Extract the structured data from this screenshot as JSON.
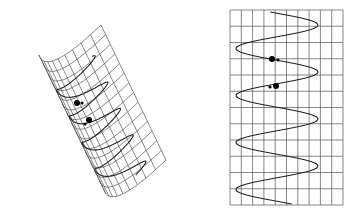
{
  "figure": {
    "colors": {
      "grid": "#555555",
      "curve": "#222222",
      "dot": "#000000",
      "background": "#ffffff"
    }
  },
  "left_panel": {
    "name": "curved-surface",
    "dots": [
      {
        "x": 77,
        "y": 103,
        "r": 3
      },
      {
        "x": 89,
        "y": 120,
        "r": 3
      }
    ]
  },
  "right_panel": {
    "name": "flat-grid",
    "grid": {
      "x0": 230,
      "y0": 10,
      "x1": 343,
      "y1": 205,
      "cols": 10,
      "rows": 12
    },
    "wave": {
      "amp_left": 236,
      "amp_right": 318,
      "peaks_y": [
        25,
        70,
        118,
        165
      ],
      "troughs_y": [
        50,
        96,
        143,
        192
      ]
    },
    "dots": [
      {
        "x": 272,
        "y": 59,
        "r": 3
      },
      {
        "x": 276,
        "y": 86,
        "r": 3
      }
    ]
  }
}
